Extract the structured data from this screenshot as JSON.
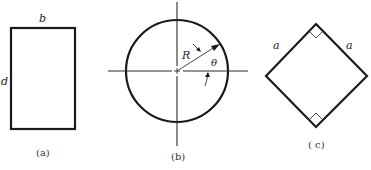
{
  "figure": {
    "panel_a": {
      "caption": "(a)",
      "shape": "rectangle",
      "labels": {
        "width": "b",
        "height": "d"
      }
    },
    "panel_b": {
      "caption": "(b)",
      "shape": "circle",
      "labels": {
        "radius": "R",
        "angle": "θ"
      }
    },
    "panel_c": {
      "caption": "( c)",
      "shape": "square rotated 45°",
      "labels": {
        "side_left": "a",
        "side_right": "a"
      }
    }
  },
  "colors": {
    "stroke": "#1a1a1a",
    "background": "#ffffff"
  }
}
